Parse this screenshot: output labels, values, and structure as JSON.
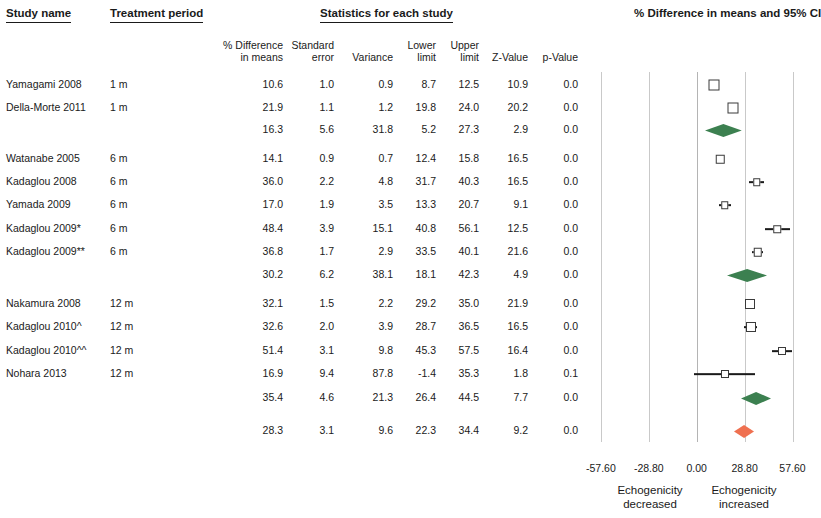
{
  "headers": {
    "study_name": "Study name",
    "treatment_period": "Treatment period",
    "statistics_group": "Statistics for each study",
    "columns": [
      {
        "line1": "% Difference",
        "line2": "in means"
      },
      {
        "line1": "Standard",
        "line2": "error"
      },
      {
        "line1": "",
        "line2": "Variance"
      },
      {
        "line1": "Lower",
        "line2": "limit"
      },
      {
        "line1": "Upper",
        "line2": "limit"
      },
      {
        "line1": "",
        "line2": "Z-Value"
      },
      {
        "line1": "",
        "line2": "p-Value"
      }
    ]
  },
  "plot": {
    "title_line1": "% Difference in",
    "title_line2": "means and 95% CI",
    "axis_ticks": [
      "-57.60",
      "-28.80",
      "0.00",
      "28.80",
      "57.60"
    ],
    "axis_note_left_line1": "Echogenicity",
    "axis_note_left_line2": "decreased",
    "axis_note_right_line1": "Echogenicity",
    "axis_note_right_line2": "increased",
    "colors": {
      "subtotal_diamond": "#3c8050",
      "overall_diamond": "#ef7050",
      "marker_outline": "#3a3a3a",
      "gridline": "#c9c9c9"
    }
  },
  "chart_data": {
    "type": "forest",
    "title": "% Difference in means and 95% CI",
    "xlabel": "% Difference in means",
    "xlim": [
      -57.6,
      57.6
    ],
    "xticks": [
      -57.6,
      -28.8,
      0.0,
      28.8,
      57.6
    ],
    "grid": true,
    "columns": [
      "Study name",
      "Treatment period",
      "% Difference in means",
      "Standard error",
      "Variance",
      "Lower limit",
      "Upper limit",
      "Z-Value",
      "p-Value"
    ],
    "rows": [
      {
        "study": "Yamagami 2008",
        "period": "1 m",
        "diff": "10.6",
        "se": "1.0",
        "var": "0.9",
        "lower": "8.7",
        "upper": "12.5",
        "z": "10.9",
        "p": "0.0",
        "diff_v": 10.6,
        "lower_v": 8.7,
        "upper_v": 12.5,
        "kind": "study",
        "y": 85,
        "size": 11
      },
      {
        "study": "Della-Morte 2011",
        "period": "1 m",
        "diff": "21.9",
        "se": "1.1",
        "var": "1.2",
        "lower": "19.8",
        "upper": "24.0",
        "z": "20.2",
        "p": "0.0",
        "diff_v": 21.9,
        "lower_v": 19.8,
        "upper_v": 24.0,
        "kind": "study",
        "y": 108,
        "size": 11
      },
      {
        "study": "",
        "period": "",
        "diff": "16.3",
        "se": "5.6",
        "var": "31.8",
        "lower": "5.2",
        "upper": "27.3",
        "z": "2.9",
        "p": "0.0",
        "diff_v": 16.3,
        "lower_v": 5.2,
        "upper_v": 27.3,
        "kind": "subtotal",
        "y": 130,
        "size": 0
      },
      {
        "study": "Watanabe 2005",
        "period": "6 m",
        "diff": "14.1",
        "se": "0.9",
        "var": "0.7",
        "lower": "12.4",
        "upper": "15.8",
        "z": "16.5",
        "p": "0.0",
        "diff_v": 14.1,
        "lower_v": 12.4,
        "upper_v": 15.8,
        "kind": "study",
        "y": 159,
        "size": 8.5
      },
      {
        "study": "Kadaglou 2008",
        "period": "6 m",
        "diff": "36.0",
        "se": "2.2",
        "var": "4.8",
        "lower": "31.7",
        "upper": "40.3",
        "z": "16.5",
        "p": "0.0",
        "diff_v": 36.0,
        "lower_v": 31.7,
        "upper_v": 40.3,
        "kind": "study",
        "y": 182,
        "size": 7.5
      },
      {
        "study": "Yamada 2009",
        "period": "6 m",
        "diff": "17.0",
        "se": "1.9",
        "var": "3.5",
        "lower": "13.3",
        "upper": "20.7",
        "z": "9.1",
        "p": "0.0",
        "diff_v": 17.0,
        "lower_v": 13.3,
        "upper_v": 20.7,
        "kind": "study",
        "y": 205,
        "size": 7.5
      },
      {
        "study": "Kadaglou 2009*",
        "period": "6 m",
        "diff": "48.4",
        "se": "3.9",
        "var": "15.1",
        "lower": "40.8",
        "upper": "56.1",
        "z": "12.5",
        "p": "0.0",
        "diff_v": 48.4,
        "lower_v": 40.8,
        "upper_v": 56.1,
        "kind": "study",
        "y": 229,
        "size": 7.5
      },
      {
        "study": "Kadaglou 2009**",
        "period": "6 m",
        "diff": "36.8",
        "se": "1.7",
        "var": "2.9",
        "lower": "33.5",
        "upper": "40.1",
        "z": "21.6",
        "p": "0.0",
        "diff_v": 36.8,
        "lower_v": 33.5,
        "upper_v": 40.1,
        "kind": "study",
        "y": 252,
        "size": 8.5
      },
      {
        "study": "",
        "period": "",
        "diff": "30.2",
        "se": "6.2",
        "var": "38.1",
        "lower": "18.1",
        "upper": "42.3",
        "z": "4.9",
        "p": "0.0",
        "diff_v": 30.2,
        "lower_v": 18.1,
        "upper_v": 42.3,
        "kind": "subtotal",
        "y": 275,
        "size": 0
      },
      {
        "study": "Nakamura 2008",
        "period": "12 m",
        "diff": "32.1",
        "se": "1.5",
        "var": "2.2",
        "lower": "29.2",
        "upper": "35.0",
        "z": "21.9",
        "p": "0.0",
        "diff_v": 32.1,
        "lower_v": 29.2,
        "upper_v": 35.0,
        "kind": "study",
        "y": 304,
        "size": 10
      },
      {
        "study": "Kadaglou 2010^",
        "period": "12 m",
        "diff": "32.6",
        "se": "2.0",
        "var": "3.9",
        "lower": "28.7",
        "upper": "36.5",
        "z": "16.5",
        "p": "0.0",
        "diff_v": 32.6,
        "lower_v": 28.7,
        "upper_v": 36.5,
        "kind": "study",
        "y": 327,
        "size": 10
      },
      {
        "study": "Kadaglou 2010^^",
        "period": "12 m",
        "diff": "51.4",
        "se": "3.1",
        "var": "9.8",
        "lower": "45.3",
        "upper": "57.5",
        "z": "16.4",
        "p": "0.0",
        "diff_v": 51.4,
        "lower_v": 45.3,
        "upper_v": 57.5,
        "kind": "study",
        "y": 351,
        "size": 8
      },
      {
        "study": "Nohara 2013",
        "period": "12 m",
        "diff": "16.9",
        "se": "9.4",
        "var": "87.8",
        "lower": "-1.4",
        "upper": "35.3",
        "z": "1.8",
        "p": "0.1",
        "diff_v": 16.9,
        "lower_v": -1.4,
        "upper_v": 35.3,
        "kind": "study",
        "y": 374,
        "size": 8
      },
      {
        "study": "",
        "period": "",
        "diff": "35.4",
        "se": "4.6",
        "var": "21.3",
        "lower": "26.4",
        "upper": "44.5",
        "z": "7.7",
        "p": "0.0",
        "diff_v": 35.4,
        "lower_v": 26.4,
        "upper_v": 44.5,
        "kind": "subtotal",
        "y": 398,
        "size": 0
      },
      {
        "study": "",
        "period": "",
        "diff": "28.3",
        "se": "3.1",
        "var": "9.6",
        "lower": "22.3",
        "upper": "34.4",
        "z": "9.2",
        "p": "0.0",
        "diff_v": 28.3,
        "lower_v": 22.3,
        "upper_v": 34.4,
        "kind": "overall",
        "y": 431,
        "size": 0
      }
    ]
  }
}
